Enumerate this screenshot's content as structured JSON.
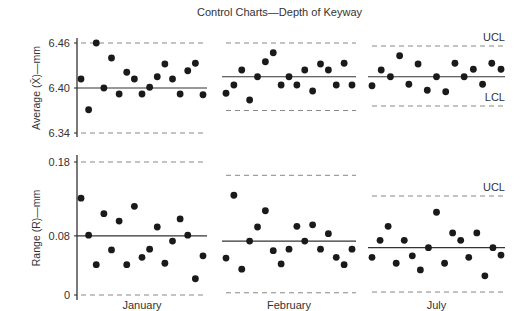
{
  "chart_data": [
    {
      "type": "scatter",
      "title": "Control Charts—Depth of Keyway",
      "subtitle": "X-bar chart",
      "ylabel": "Average (X̄)—mm",
      "xlabel": "",
      "yticks": [
        6.34,
        6.4,
        6.46
      ],
      "ylim": [
        6.335,
        6.47
      ],
      "grid": false,
      "panels": [
        {
          "name": "January",
          "center": 6.4,
          "ucl": 6.46,
          "lcl": 6.34,
          "values": [
            6.412,
            6.371,
            6.46,
            6.4,
            6.44,
            6.392,
            6.421,
            6.412,
            6.392,
            6.401,
            6.415,
            6.432,
            6.412,
            6.392,
            6.423,
            6.433,
            6.391
          ]
        },
        {
          "name": "February",
          "center": 6.415,
          "ucl": 6.46,
          "lcl": 6.37,
          "values": [
            6.393,
            6.404,
            6.424,
            6.384,
            6.415,
            6.435,
            6.447,
            6.404,
            6.415,
            6.404,
            6.424,
            6.396,
            6.432,
            6.424,
            6.404,
            6.433,
            6.404
          ]
        },
        {
          "name": "July",
          "center": 6.415,
          "ucl": 6.456,
          "lcl": 6.376,
          "values": [
            6.403,
            6.424,
            6.415,
            6.443,
            6.405,
            6.432,
            6.397,
            6.415,
            6.395,
            6.433,
            6.415,
            6.425,
            6.405,
            6.433,
            6.425
          ]
        }
      ]
    },
    {
      "type": "scatter",
      "subtitle": "Range chart",
      "ylabel": "Range (R)—mm",
      "xlabel": "",
      "yticks": [
        0,
        0.08,
        0.18
      ],
      "ylim": [
        -0.005,
        0.19
      ],
      "grid": false,
      "panels": [
        {
          "name": "January",
          "center": 0.08,
          "ucl": 0.18,
          "lcl": 0,
          "values": [
            0.131,
            0.081,
            0.041,
            0.11,
            0.061,
            0.1,
            0.041,
            0.12,
            0.051,
            0.062,
            0.092,
            0.043,
            0.073,
            0.103,
            0.081,
            0.022,
            0.053
          ]
        },
        {
          "name": "February",
          "center": 0.073,
          "ucl": 0.162,
          "lcl": 0.003,
          "values": [
            0.05,
            0.135,
            0.035,
            0.073,
            0.092,
            0.114,
            0.06,
            0.042,
            0.062,
            0.093,
            0.073,
            0.095,
            0.062,
            0.083,
            0.051,
            0.041,
            0.062
          ]
        },
        {
          "name": "July",
          "center": 0.064,
          "ucl": 0.134,
          "lcl": 0.004,
          "values": [
            0.051,
            0.074,
            0.093,
            0.043,
            0.074,
            0.053,
            0.034,
            0.064,
            0.112,
            0.043,
            0.084,
            0.074,
            0.051,
            0.084,
            0.026,
            0.064,
            0.054
          ]
        }
      ]
    }
  ],
  "labels": {
    "title": "Control Charts—Depth of Keyway",
    "xbar_ylabel": "Average (X̄)—mm",
    "range_ylabel": "Range (R)—mm",
    "ucl": "UCL",
    "lcl": "LCL",
    "months": [
      "January",
      "February",
      "July"
    ]
  }
}
